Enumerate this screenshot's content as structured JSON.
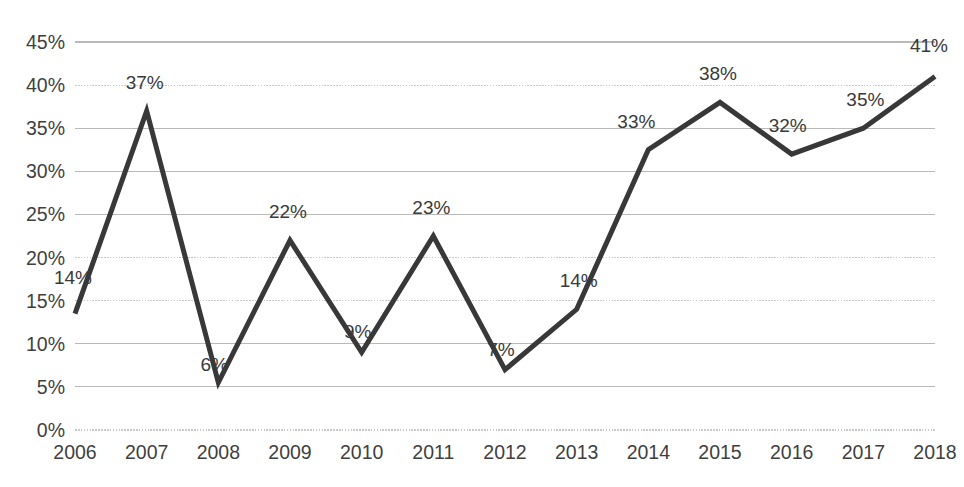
{
  "chart_data": {
    "type": "line",
    "title": "",
    "subtitle": "",
    "xlabel": "",
    "ylabel": "",
    "categories": [
      "2006",
      "2007",
      "2008",
      "2009",
      "2010",
      "2011",
      "2012",
      "2013",
      "2014",
      "2015",
      "2016",
      "2017",
      "2018"
    ],
    "values": [
      13.5,
      37,
      5.5,
      22,
      9,
      22.5,
      7,
      14,
      32.5,
      38,
      32,
      35,
      41
    ],
    "data_labels": [
      "14%",
      "37%",
      "6%",
      "22%",
      "9%",
      "23%",
      "7%",
      "14%",
      "33%",
      "38%",
      "32%",
      "35%",
      "41%"
    ],
    "ylim": [
      0,
      45
    ],
    "ytick_values": [
      0,
      5,
      10,
      15,
      20,
      25,
      30,
      35,
      40,
      45
    ],
    "ytick_labels": [
      "0%",
      "5%",
      "10%",
      "15%",
      "20%",
      "25%",
      "30%",
      "35%",
      "40%",
      "45%"
    ],
    "grid": true,
    "grid_axis": "y",
    "legend": false,
    "legend_position": "none",
    "series": [
      {
        "name": "",
        "color": "#383838",
        "values": [
          13.5,
          37,
          5.5,
          22,
          9,
          22.5,
          7,
          14,
          32.5,
          38,
          32,
          35,
          41
        ]
      }
    ],
    "label_offsets": [
      {
        "dx": -2,
        "dy": -30
      },
      {
        "dx": -2,
        "dy": -22
      },
      {
        "dx": -4,
        "dy": -12
      },
      {
        "dx": -2,
        "dy": -22
      },
      {
        "dx": -4,
        "dy": -14
      },
      {
        "dx": -2,
        "dy": -22
      },
      {
        "dx": -4,
        "dy": -14
      },
      {
        "dx": 2,
        "dy": -22
      },
      {
        "dx": -12,
        "dy": -22
      },
      {
        "dx": -2,
        "dy": -22
      },
      {
        "dx": -4,
        "dy": -22
      },
      {
        "dx": 2,
        "dy": -22
      },
      {
        "dx": -6,
        "dy": -24
      }
    ],
    "grid_styles": [
      "dotted",
      "solid",
      "solid",
      "dotted",
      "dotted",
      "solid",
      "solid",
      "solid",
      "dotted",
      "solid"
    ],
    "colors": {
      "line": "#383838",
      "grid": "#b9b9b9",
      "text": "#3f3f3f",
      "label": "#3a3a3a",
      "background": "#ffffff"
    },
    "plot_area": {
      "left": 75,
      "right": 935,
      "top": 42,
      "bottom": 430
    }
  }
}
